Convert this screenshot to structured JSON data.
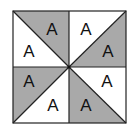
{
  "figure": {
    "colors": {
      "shaded": "#a9a9a9",
      "unshaded": "#ffffff",
      "line": "#222222"
    },
    "square": {
      "x0": 13,
      "y0": 11,
      "x1": 126,
      "y1": 123,
      "cx": 69,
      "cy": 67
    },
    "labels": {
      "tl_gray": "A",
      "tl_white": "A",
      "tr_white": "A",
      "tr_gray": "A",
      "bl_gray": "A",
      "bl_white": "A",
      "br_white": "A",
      "br_gray": "A"
    }
  }
}
